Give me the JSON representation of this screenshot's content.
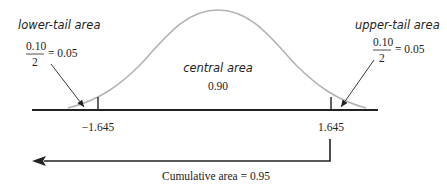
{
  "labels": {
    "lower_tail_title": "lower-tail area",
    "lower_tail_numerator": "0.10",
    "lower_tail_denominator": "2",
    "lower_tail_result": "= 0.05",
    "upper_tail_title": "upper-tail area",
    "upper_tail_numerator": "0.10",
    "upper_tail_denominator": "2",
    "upper_tail_result": "= 0.05",
    "central_title": "central area",
    "central_value": "0.90",
    "left_critical": "−1.645",
    "right_critical": "1.645",
    "cumulative": "Cumulative area = 0.95"
  },
  "colors": {
    "curve": "#b3b3b3",
    "axis": "#222222",
    "text": "#222222"
  }
}
